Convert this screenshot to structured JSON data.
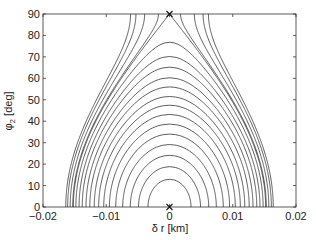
{
  "chart_data": {
    "type": "contour",
    "title": "",
    "xlabel": "δ r [km]",
    "ylabel": "φ2 [deg]",
    "ylabel_main": "φ",
    "ylabel_sub": "2",
    "ylabel_unit": " [deg]",
    "xlim": [
      -0.02,
      0.02
    ],
    "ylim": [
      0,
      90
    ],
    "xticks": [
      -0.02,
      -0.01,
      0,
      0.01,
      0.02
    ],
    "xtick_labels": [
      "-0.02",
      "-0.01",
      "0",
      "0.01",
      "0.02"
    ],
    "yticks": [
      0,
      10,
      20,
      30,
      40,
      50,
      60,
      70,
      80,
      90
    ],
    "ytick_labels": [
      "0",
      "10",
      "20",
      "30",
      "40",
      "50",
      "60",
      "70",
      "80",
      "90"
    ],
    "grid": false,
    "legend": null,
    "model": "level curves of δr^2 + A·sin^2(φ2), A = 0.0152^2",
    "separatrix_amplitude": 0.0152,
    "contour_bottom_radii": [
      0.0034,
      0.0049,
      0.0062,
      0.0074,
      0.0085,
      0.0095,
      0.0104,
      0.0112,
      0.0119,
      0.0126,
      0.0132,
      0.0138,
      0.0143,
      0.0148,
      0.0153,
      0.0157,
      0.0161,
      0.0164
    ],
    "markers": [
      {
        "symbol": "x",
        "x": 0,
        "y": 90,
        "label": "saddle point"
      },
      {
        "symbol": "x",
        "x": 0,
        "y": 0,
        "label": "center"
      }
    ],
    "line_color": "#333333"
  }
}
